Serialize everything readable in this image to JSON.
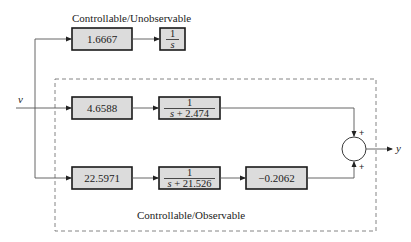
{
  "diagram": {
    "labels": {
      "top_group": "Controllable/Unobservable",
      "bottom_group": "Controllable/Observable",
      "input": "v",
      "output": "y"
    },
    "top_path": {
      "gain": "1.6667",
      "integrator_num": "1",
      "integrator_den": "s"
    },
    "middle_path": {
      "gain": "4.6588",
      "tf_num": "1",
      "tf_den": "s + 2.474"
    },
    "bottom_path": {
      "gain": "22.5971",
      "tf_num": "1",
      "tf_den": "s + 21.526",
      "output_gain": "−0.2062"
    },
    "summing_junction": {
      "sign_top": "+",
      "sign_bottom": "+"
    }
  }
}
